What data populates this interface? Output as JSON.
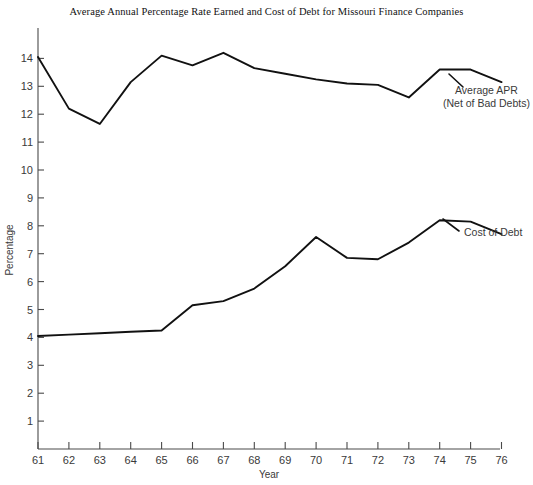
{
  "chart_data": {
    "type": "line",
    "title": "Average Annual Percentage Rate Earned and Cost of Debt for Missouri Finance Companies",
    "xlabel": "Year",
    "ylabel": "Percentage",
    "grid": false,
    "legend_position": "inline-right-annotations",
    "x": [
      61,
      62,
      63,
      64,
      65,
      66,
      67,
      68,
      69,
      70,
      71,
      72,
      73,
      74,
      75,
      76
    ],
    "x_tick_labels": [
      "61",
      "62",
      "63",
      "64",
      "65",
      "66",
      "67",
      "68",
      "69",
      "70",
      "71",
      "72",
      "73",
      "74",
      "75",
      "76"
    ],
    "y_tick_labels": [
      "1",
      "2",
      "3",
      "4",
      "5",
      "6",
      "7",
      "8",
      "9",
      "10",
      "11",
      "12",
      "13",
      "14"
    ],
    "y_ticks": [
      1,
      2,
      3,
      4,
      5,
      6,
      7,
      8,
      9,
      10,
      11,
      12,
      13,
      14
    ],
    "ylim": [
      0,
      14.6
    ],
    "xlim": [
      61,
      76
    ],
    "series": [
      {
        "name": "Average APR (Net of Bad Debts)",
        "label_line_1": "Average APR",
        "label_line_2": "(Net of Bad Debts)",
        "color": "#111111",
        "values": [
          14.05,
          12.2,
          11.65,
          13.15,
          14.1,
          13.75,
          14.2,
          13.65,
          13.45,
          13.25,
          13.1,
          13.05,
          12.6,
          13.6,
          13.6,
          13.15
        ]
      },
      {
        "name": "Cost of Debt",
        "label_line_1": "Cost of Debt",
        "label_line_2": "",
        "color": "#111111",
        "values": [
          4.05,
          4.1,
          4.15,
          4.2,
          4.25,
          5.15,
          5.3,
          5.75,
          6.55,
          7.6,
          6.85,
          6.8,
          7.4,
          8.2,
          8.15,
          7.7
        ]
      }
    ],
    "annotations": [
      {
        "text": "Average APR",
        "for_series": "Average APR (Net of Bad Debts)"
      },
      {
        "text": "(Net of Bad Debts)",
        "for_series": "Average APR (Net of Bad Debts)"
      },
      {
        "text": "Cost of Debt",
        "for_series": "Cost of Debt"
      }
    ]
  }
}
